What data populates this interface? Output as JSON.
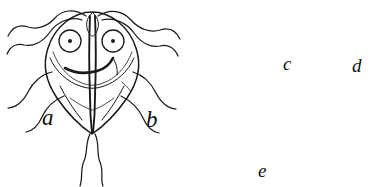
{
  "figure": {
    "kind": "scientific-line-drawing",
    "background_color": "#ffffff",
    "ink_color": "#1a1a1a",
    "cytoplasm_color": "#e8e8e8",
    "panels": [
      {
        "id": "a",
        "label": "a",
        "caption": "trophozoite, ventral view",
        "nuclei": 2,
        "flagella_pairs": 4
      },
      {
        "id": "b",
        "label": "b",
        "caption": "trophozoite, lateral view",
        "nuclei": 1,
        "flagella_pairs": 4
      },
      {
        "id": "c",
        "label": "c",
        "caption": "cyst, two nuclei",
        "nuclei": 2
      },
      {
        "id": "d",
        "label": "d",
        "caption": "cyst, developing",
        "nuclei": 2
      },
      {
        "id": "e",
        "label": "e",
        "caption": "mature cyst, four nuclei",
        "nuclei": 4
      }
    ]
  }
}
